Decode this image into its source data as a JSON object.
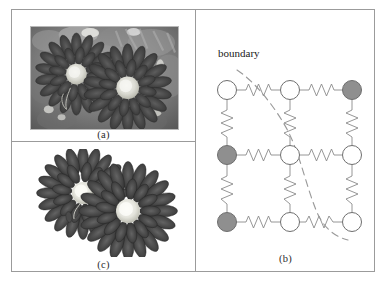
{
  "figure": {
    "panels": [
      {
        "id": "a",
        "caption": "(a)",
        "kind": "photograph",
        "description": "grayscale close-up photograph of two chrysanthemum flowers with bright centers"
      },
      {
        "id": "c",
        "caption": "(c)",
        "kind": "photograph",
        "description": "segmented grayscale image of the two chrysanthemum flowers isolated on a white background"
      },
      {
        "id": "b",
        "caption": "(b)",
        "kind": "diagram",
        "description": "3 by 3 grid of nodes connected by spring links with a dashed boundary curve"
      }
    ]
  },
  "diagram": {
    "label_boundary": "boundary",
    "colors": {
      "node_fill_open": "#ffffff",
      "node_fill_shaded": "#8f8f8f",
      "node_stroke": "#6e6e6e",
      "link_stroke": "#8a8a8a",
      "boundary_stroke": "#9a9a9a",
      "panel_border": "#9b9b9b"
    },
    "grid": {
      "rows": 3,
      "cols": 3,
      "col_x": [
        31,
        94,
        156
      ],
      "row_y": [
        81,
        146,
        213
      ],
      "node_radius": 9.5
    },
    "nodes": [
      {
        "row": 0,
        "col": 0,
        "state": "open"
      },
      {
        "row": 0,
        "col": 1,
        "state": "open"
      },
      {
        "row": 0,
        "col": 2,
        "state": "shaded"
      },
      {
        "row": 1,
        "col": 0,
        "state": "shaded"
      },
      {
        "row": 1,
        "col": 1,
        "state": "open"
      },
      {
        "row": 1,
        "col": 2,
        "state": "open"
      },
      {
        "row": 2,
        "col": 0,
        "state": "shaded"
      },
      {
        "row": 2,
        "col": 1,
        "state": "open"
      },
      {
        "row": 2,
        "col": 2,
        "state": "open"
      }
    ],
    "links": [
      {
        "from": [
          0,
          0
        ],
        "to": [
          0,
          1
        ],
        "orientation": "horizontal",
        "type": "spring"
      },
      {
        "from": [
          0,
          1
        ],
        "to": [
          0,
          2
        ],
        "orientation": "horizontal",
        "type": "spring"
      },
      {
        "from": [
          1,
          0
        ],
        "to": [
          1,
          1
        ],
        "orientation": "horizontal",
        "type": "spring"
      },
      {
        "from": [
          1,
          1
        ],
        "to": [
          1,
          2
        ],
        "orientation": "horizontal",
        "type": "spring"
      },
      {
        "from": [
          2,
          0
        ],
        "to": [
          2,
          1
        ],
        "orientation": "horizontal",
        "type": "spring"
      },
      {
        "from": [
          2,
          1
        ],
        "to": [
          2,
          2
        ],
        "orientation": "horizontal",
        "type": "spring"
      },
      {
        "from": [
          0,
          0
        ],
        "to": [
          1,
          0
        ],
        "orientation": "vertical",
        "type": "spring"
      },
      {
        "from": [
          0,
          1
        ],
        "to": [
          1,
          1
        ],
        "orientation": "vertical",
        "type": "spring"
      },
      {
        "from": [
          0,
          2
        ],
        "to": [
          1,
          2
        ],
        "orientation": "vertical",
        "type": "spring"
      },
      {
        "from": [
          1,
          0
        ],
        "to": [
          2,
          0
        ],
        "orientation": "vertical",
        "type": "spring"
      },
      {
        "from": [
          1,
          1
        ],
        "to": [
          2,
          1
        ],
        "orientation": "vertical",
        "type": "spring"
      },
      {
        "from": [
          1,
          2
        ],
        "to": [
          2,
          2
        ],
        "orientation": "vertical",
        "type": "spring"
      }
    ],
    "boundary_curve": {
      "style": "dashed",
      "path": "M 41 61 C 58 72, 78 96, 92 122 C 104 146, 110 176, 120 201 C 126 216, 136 227, 152 231"
    }
  }
}
